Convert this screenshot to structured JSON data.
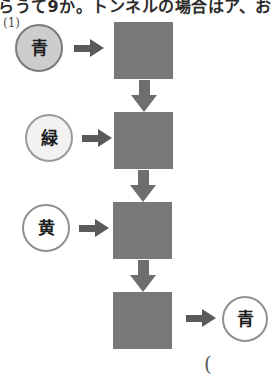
{
  "page": {
    "width": 277,
    "height": 390,
    "background": "#ffffff"
  },
  "header": {
    "cropped_text": "らうて9か。トンネルの場合はア、お"
  },
  "question": {
    "number_label": "(1)"
  },
  "flow": {
    "steps": [
      {
        "circle_label": "青",
        "circle_fill": "#cdcdcd",
        "arrow_right": "arrow-right-icon",
        "square_fill": "#787878"
      },
      {
        "circle_label": "緑",
        "circle_fill": "#f2f2f2",
        "arrow_right": "arrow-right-icon",
        "square_fill": "#787878"
      },
      {
        "circle_label": "黄",
        "circle_fill": "#ffffff",
        "arrow_right": "arrow-right-icon",
        "square_fill": "#787878"
      },
      {
        "circle_label": "",
        "circle_fill": "#ffffff",
        "arrow_right": "arrow-right-icon",
        "square_fill": "#787878"
      }
    ],
    "down_arrows": [
      "arrow-down-icon",
      "arrow-down-icon",
      "arrow-down-icon"
    ],
    "result": {
      "circle_label": "青",
      "circle_fill": "#ffffff"
    }
  },
  "footer": {
    "open_paren": "("
  },
  "colors": {
    "square_gray": "#787878",
    "arrow_gray": "#5a5a5a",
    "down_arrow_gray": "#6e6e6e",
    "circle_border": "#8a8a8a",
    "text_dark": "#1c1c1c"
  }
}
